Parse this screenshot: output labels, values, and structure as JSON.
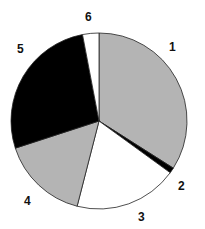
{
  "chart_data": {
    "type": "pie",
    "title": "",
    "categories": [
      "1",
      "2",
      "3",
      "4",
      "5",
      "6"
    ],
    "values": [
      34,
      1,
      19,
      16,
      27,
      3
    ],
    "start_angle_deg": 0,
    "direction": "clockwise",
    "legend": "none (slice labels outside)",
    "colors": [
      "#b4b4b4",
      "#000000",
      "#ffffff",
      "#b4b4b4",
      "#000000",
      "#ffffff"
    ]
  },
  "labels": {
    "s1": "1",
    "s2": "2",
    "s3": "3",
    "s4": "4",
    "s5": "5",
    "s6": "6"
  }
}
